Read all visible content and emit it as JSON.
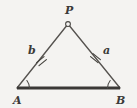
{
  "figure": {
    "type": "geometry-diagram",
    "shape": "isosceles-triangle",
    "background_color": "#f4f3f1",
    "ink_color": "#3b3a38",
    "base_color": "#3a3836"
  },
  "vertices": [
    {
      "id": "P",
      "label": "P",
      "x": 68,
      "y": 24,
      "label_x": 65,
      "label_y": 14,
      "marker": "open-circle"
    },
    {
      "id": "A",
      "label": "A",
      "x": 17,
      "y": 88,
      "label_x": 13,
      "label_y": 104,
      "marker": "angle-arc"
    },
    {
      "id": "B",
      "label": "B",
      "x": 120,
      "y": 88,
      "label_x": 116,
      "label_y": 104,
      "marker": "angle-arc"
    }
  ],
  "sides": [
    {
      "id": "PA",
      "label": "b",
      "label_x": 28,
      "label_y": 54,
      "from": "A",
      "to": "P",
      "ticks": 2,
      "weight": "thin"
    },
    {
      "id": "PB",
      "label": "a",
      "label_x": 103,
      "label_y": 54,
      "from": "P",
      "to": "B",
      "ticks": 2,
      "weight": "thin"
    },
    {
      "id": "AB",
      "label": "",
      "from": "A",
      "to": "B",
      "ticks": 0,
      "weight": "thick"
    }
  ],
  "geometry_paths": {
    "left_leg": "M 17 88 L 68 24",
    "right_leg": "M 68 24 L 120 88",
    "base": "M 17 88 L 120 88"
  },
  "tick_marks": {
    "left": [
      "M 36.6 62.6 L 44.0 56.6",
      "M 39.0 65.6 L 46.4 59.6"
    ],
    "right": [
      "M 90.6 56.6 L 98.0 62.6",
      "M 93.0 53.6 L 100.4 59.6"
    ]
  },
  "angle_arcs": {
    "A": "M 29.5 88 A 12.5 12.5 0 0 0 26.9 80.5",
    "B": "M 107.5 88 A 12.5 12.5 0 0 1 110.2 80.5"
  },
  "apex_marker": {
    "cx": 68,
    "cy": 24,
    "r": 2.4
  },
  "label_font_size": 11
}
